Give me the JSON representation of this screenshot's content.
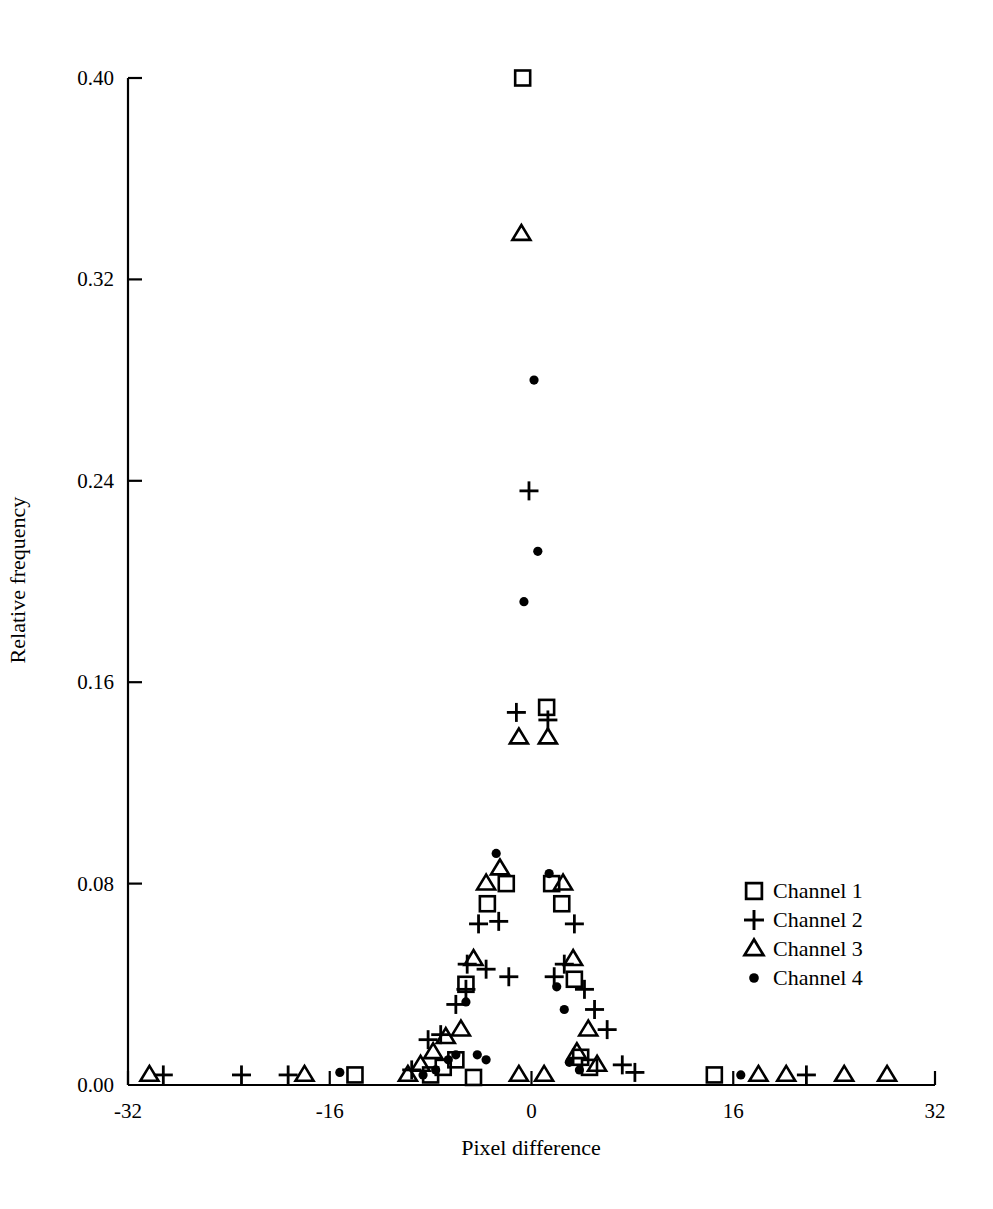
{
  "chart_data": {
    "type": "scatter",
    "title": "",
    "xlabel": "Pixel difference",
    "ylabel": "Relative frequency",
    "xlim": [
      -32,
      32
    ],
    "ylim": [
      0.0,
      0.4
    ],
    "xticks": [
      -32,
      -16,
      0,
      16,
      32
    ],
    "xtick_labels": [
      "-32",
      "-16",
      "0",
      "16",
      "32"
    ],
    "yticks": [
      0.0,
      0.08,
      0.16,
      0.24,
      0.32,
      0.4
    ],
    "ytick_labels": [
      "0.00",
      "0.08",
      "0.16",
      "0.24",
      "0.32",
      "0.40"
    ],
    "grid": false,
    "legend_position": "center-right",
    "series": [
      {
        "name": "Channel 1",
        "marker": "square",
        "points": [
          [
            -14.0,
            0.004
          ],
          [
            -8.0,
            0.004
          ],
          [
            -7.0,
            0.007
          ],
          [
            -6.0,
            0.01
          ],
          [
            -5.2,
            0.04
          ],
          [
            -4.6,
            0.003
          ],
          [
            -3.5,
            0.072
          ],
          [
            -2.0,
            0.08
          ],
          [
            -0.7,
            0.4
          ],
          [
            1.2,
            0.15
          ],
          [
            1.6,
            0.08
          ],
          [
            2.4,
            0.072
          ],
          [
            3.4,
            0.042
          ],
          [
            3.9,
            0.011
          ],
          [
            4.6,
            0.007
          ],
          [
            14.5,
            0.004
          ]
        ]
      },
      {
        "name": "Channel 2",
        "marker": "plus",
        "points": [
          [
            -29.2,
            0.004
          ],
          [
            -23.0,
            0.004
          ],
          [
            -19.3,
            0.004
          ],
          [
            -9.5,
            0.006
          ],
          [
            -8.2,
            0.018
          ],
          [
            -7.2,
            0.02
          ],
          [
            -6.0,
            0.032
          ],
          [
            -5.2,
            0.038
          ],
          [
            -5.1,
            0.048
          ],
          [
            -4.2,
            0.064
          ],
          [
            -3.6,
            0.046
          ],
          [
            -2.6,
            0.065
          ],
          [
            -1.8,
            0.043
          ],
          [
            -1.2,
            0.148
          ],
          [
            -0.2,
            0.236
          ],
          [
            1.3,
            0.145
          ],
          [
            1.8,
            0.043
          ],
          [
            2.6,
            0.048
          ],
          [
            3.4,
            0.064
          ],
          [
            4.2,
            0.038
          ],
          [
            5.0,
            0.03
          ],
          [
            6.0,
            0.022
          ],
          [
            7.2,
            0.008
          ],
          [
            8.2,
            0.005
          ],
          [
            21.8,
            0.004
          ]
        ]
      },
      {
        "name": "Channel 3",
        "marker": "triangle",
        "points": [
          [
            -30.3,
            0.004
          ],
          [
            -18.0,
            0.004
          ],
          [
            -9.8,
            0.004
          ],
          [
            -8.8,
            0.008
          ],
          [
            -7.8,
            0.013
          ],
          [
            -6.8,
            0.019
          ],
          [
            -5.6,
            0.022
          ],
          [
            -4.6,
            0.05
          ],
          [
            -3.6,
            0.08
          ],
          [
            -2.5,
            0.086
          ],
          [
            -1.0,
            0.138
          ],
          [
            -0.8,
            0.338
          ],
          [
            -1.0,
            0.004
          ],
          [
            1.0,
            0.004
          ],
          [
            1.3,
            0.138
          ],
          [
            2.5,
            0.08
          ],
          [
            3.3,
            0.05
          ],
          [
            3.6,
            0.013
          ],
          [
            4.5,
            0.022
          ],
          [
            5.2,
            0.008
          ],
          [
            18.0,
            0.004
          ],
          [
            20.2,
            0.004
          ],
          [
            24.8,
            0.004
          ],
          [
            28.2,
            0.004
          ]
        ]
      },
      {
        "name": "Channel 4",
        "marker": "dot",
        "points": [
          [
            -15.2,
            0.005
          ],
          [
            -8.6,
            0.004
          ],
          [
            -7.6,
            0.006
          ],
          [
            -6.6,
            0.01
          ],
          [
            -6.0,
            0.012
          ],
          [
            -5.2,
            0.033
          ],
          [
            -4.3,
            0.012
          ],
          [
            -3.6,
            0.01
          ],
          [
            -2.8,
            0.092
          ],
          [
            -0.6,
            0.192
          ],
          [
            0.5,
            0.212
          ],
          [
            0.2,
            0.28
          ],
          [
            1.4,
            0.084
          ],
          [
            2.0,
            0.039
          ],
          [
            2.6,
            0.03
          ],
          [
            3.0,
            0.009
          ],
          [
            3.8,
            0.006
          ],
          [
            16.6,
            0.004
          ]
        ]
      }
    ]
  },
  "legend": {
    "items": [
      {
        "marker": "square",
        "label": "Channel 1"
      },
      {
        "marker": "plus",
        "label": "Channel 2"
      },
      {
        "marker": "triangle",
        "label": "Channel 3"
      },
      {
        "marker": "dot",
        "label": "Channel 4"
      }
    ]
  }
}
